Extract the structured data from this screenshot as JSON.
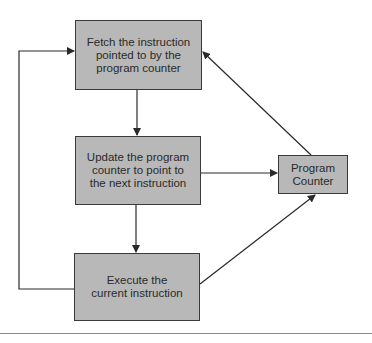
{
  "diagram": {
    "title": "",
    "nodes": [
      {
        "id": "fetch",
        "lines": [
          "Fetch the instruction",
          "pointed to by the",
          "program counter"
        ]
      },
      {
        "id": "update",
        "lines": [
          "Update the program",
          "counter to point to",
          "the next instruction"
        ]
      },
      {
        "id": "execute",
        "lines": [
          "Execute the",
          "current instruction"
        ]
      },
      {
        "id": "pc",
        "lines": [
          "Program",
          "Counter"
        ]
      }
    ],
    "edges": [
      {
        "from": "fetch",
        "to": "update"
      },
      {
        "from": "update",
        "to": "execute"
      },
      {
        "from": "execute",
        "to": "fetch"
      },
      {
        "from": "update",
        "to": "pc"
      },
      {
        "from": "execute",
        "to": "pc"
      },
      {
        "from": "pc",
        "to": "fetch"
      }
    ],
    "colors": {
      "box_fill": "#b8b8b8",
      "line": "#2a2a2a",
      "text": "#2a2a2a"
    }
  }
}
